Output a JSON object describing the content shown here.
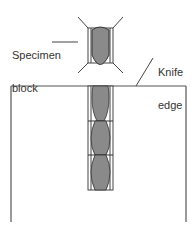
{
  "diagram": {
    "labels": {
      "specimen_block": [
        "Specimen",
        "block"
      ],
      "knife_edge": [
        "Knife",
        "edge"
      ]
    },
    "colors": {
      "outline": "#444444",
      "specimen_fill": "#8a8a8a",
      "background": "#ffffff"
    },
    "components": {
      "specimen_block": "Specimen block with embedded tissue (gray oval) and four diagonal clamp lines",
      "knife": "Knife shown as open rectangle; top edge is the knife edge",
      "ribbon": "Ribbon of three serial sections on knife surface, each with a gray tissue profile"
    }
  }
}
